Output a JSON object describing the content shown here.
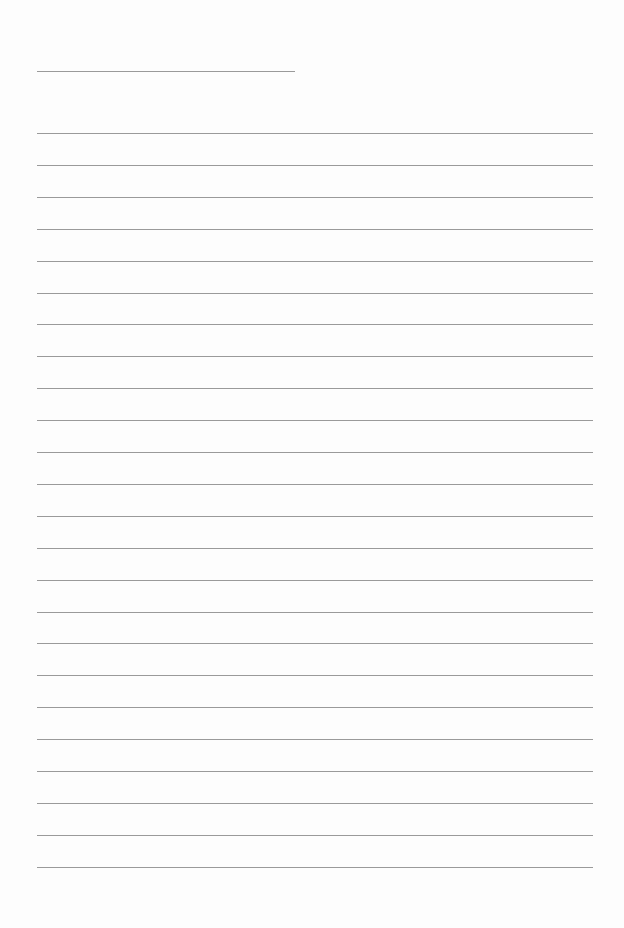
{
  "page": {
    "type": "lined-paper",
    "title_line": {
      "x": 37,
      "y": 71,
      "width": 258
    },
    "ruled_lines": {
      "count": 24,
      "x": 37,
      "width": 556,
      "first_y": 133,
      "spacing": 31.9
    },
    "line_color": "#9a9a9a",
    "background": "#fdfdfd"
  }
}
